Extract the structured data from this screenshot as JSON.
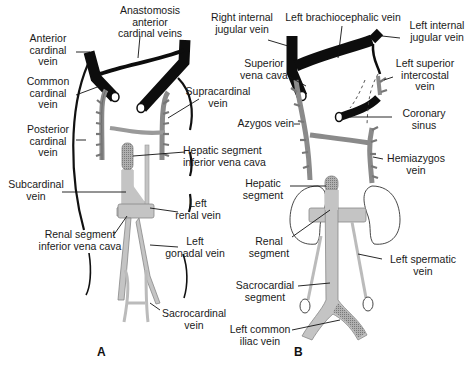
{
  "figure": {
    "panels": [
      {
        "id": "A",
        "letter": "A",
        "labels": {
          "anastomosis": "Anastomosis\nanterior\ncardinal veins",
          "anterior_cardinal": "Anterior\ncardinal\nvein",
          "common_cardinal": "Common\ncardinal\nvein",
          "supracardinal": "Supracardinal\nvein",
          "posterior_cardinal": "Posterior\ncardinal\nvein",
          "hepatic_segment_ivc": "Hepatic segment\ninferior vena cava",
          "subcardinal": "Subcardinal\nvein",
          "left_renal": "Left\nrenal vein",
          "renal_segment_ivc": "Renal segment\ninferior vena cava",
          "left_gonadal": "Left\ngonadal vein",
          "sacrocardinal": "Sacrocardinal\nvein"
        }
      },
      {
        "id": "B",
        "letter": "B",
        "labels": {
          "right_internal_jugular": "Right internal\njugular vein",
          "left_brachiocephalic": "Left brachiocephalic vein",
          "left_internal_jugular": "Left internal\njugular vein",
          "superior_vena_cava": "Superior\nvena cava",
          "left_superior_intercostal": "Left superior\nintercostal\nvein",
          "coronary_sinus": "Coronary\nsinus",
          "azygos": "Azygos vein",
          "hemiazygos": "Hemiazygos\nvein",
          "hepatic_segment": "Hepatic\nsegment",
          "renal_segment": "Renal\nsegment",
          "left_spermatic": "Left spermatic\nvein",
          "sacrocardial_segment": "Sacrocardial\nsegment",
          "left_common_iliac": "Left common\niliac vein"
        }
      }
    ],
    "colors": {
      "cardinal_black": "#0d0d0d",
      "supracardinal_gray": "#8a8a8a",
      "subcardinal_light": "#c4c4c4",
      "hatched": "#9a9a9a",
      "text": "#1a1a1a"
    }
  }
}
